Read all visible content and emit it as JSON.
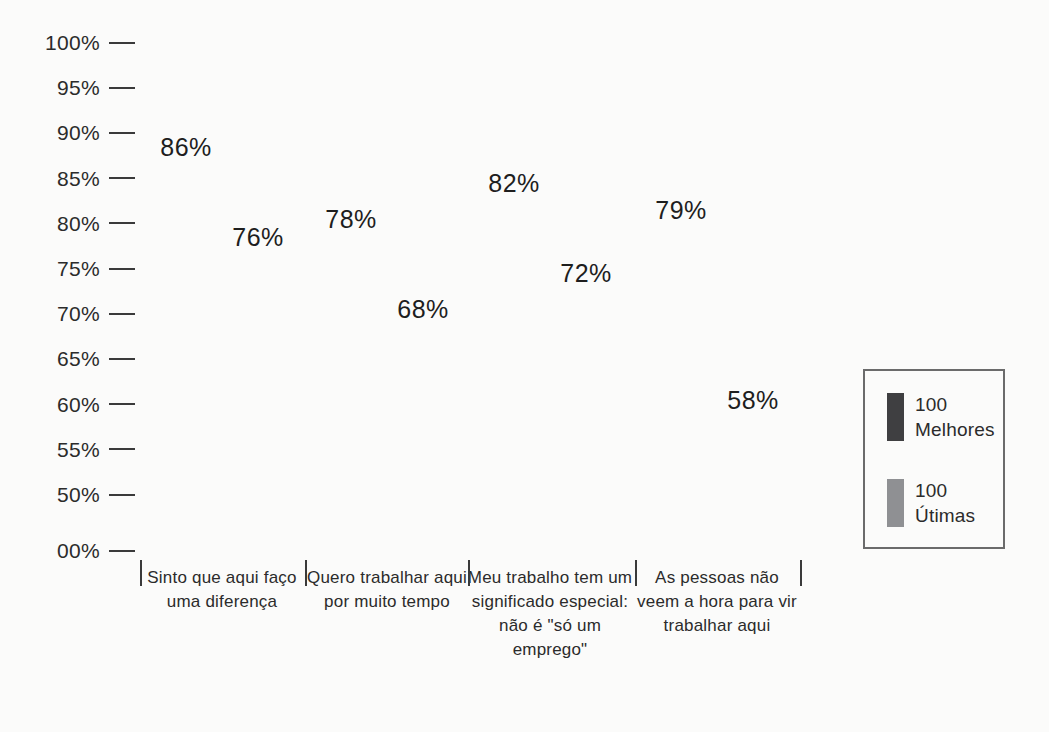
{
  "chart_data": {
    "type": "bar",
    "title": "",
    "xlabel": "",
    "ylabel": "",
    "ylim": [
      0,
      100
    ],
    "grid": false,
    "legend_position": "right",
    "y_ticks": [
      "100%",
      "95%",
      "90%",
      "85%",
      "80%",
      "75%",
      "70%",
      "65%",
      "60%",
      "55%",
      "50%",
      "00%"
    ],
    "y_tick_values": [
      100,
      95,
      90,
      85,
      80,
      75,
      70,
      65,
      60,
      55,
      50,
      0
    ],
    "categories": [
      "Sinto que\naqui faço uma\ndiferença",
      "Quero trabalhar\naqui por muito\ntempo",
      "Meu trabalho\ntem um\nsignificado\nespecial:\nnão é \"só um\nemprego\"",
      "As pessoas\nnão veem a\nhora para vir\ntrabalhar aqui"
    ],
    "series": [
      {
        "name": "100\nMelhores",
        "color": "#5a5a5c",
        "values": [
          86,
          78,
          82,
          79
        ],
        "labels": [
          "86%",
          "78%",
          "82%",
          "79%"
        ]
      },
      {
        "name": "100\nÚtimas",
        "color": "#adadae",
        "values": [
          76,
          68,
          72,
          58
        ],
        "labels": [
          "76%",
          "68%",
          "72%",
          "58%"
        ]
      }
    ]
  },
  "legend": {
    "entries": [
      {
        "label": "100\nMelhores",
        "swatch": "dark-swatch"
      },
      {
        "label": "100\nÚtimas",
        "swatch": "light-swatch"
      }
    ]
  },
  "footer": {
    "ghost_text": ""
  }
}
